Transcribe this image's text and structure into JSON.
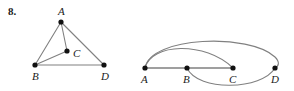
{
  "exercise": {
    "number": "8."
  },
  "style": {
    "edge_color": "#808080",
    "vertex_color": "#111111",
    "label_color": "#1a1a1a",
    "background": "#ffffff",
    "edge_width": 1.1,
    "vertex_radius": 2.6
  },
  "figures": [
    {
      "id": "left-graph",
      "name": "triangle-with-interior-point",
      "vertices": [
        {
          "id": "A",
          "label": "A",
          "x": 61,
          "y": 22,
          "label_x": 58,
          "label_y": 14
        },
        {
          "id": "B",
          "label": "B",
          "x": 35,
          "y": 65,
          "label_x": 32,
          "label_y": 79
        },
        {
          "id": "C",
          "label": "C",
          "x": 67,
          "y": 51,
          "label_x": 73,
          "label_y": 56
        },
        {
          "id": "D",
          "label": "D",
          "x": 104,
          "y": 65,
          "label_x": 101,
          "label_y": 79
        }
      ],
      "edges": [
        {
          "from": "A",
          "to": "B",
          "type": "line"
        },
        {
          "from": "A",
          "to": "D",
          "type": "line"
        },
        {
          "from": "B",
          "to": "D",
          "type": "line"
        },
        {
          "from": "A",
          "to": "C",
          "type": "line"
        },
        {
          "from": "B",
          "to": "C",
          "type": "line"
        }
      ]
    },
    {
      "id": "right-graph",
      "name": "collinear-vertices-with-arcs",
      "vertices": [
        {
          "id": "A",
          "label": "A",
          "x": 145,
          "y": 68,
          "label_x": 141,
          "label_y": 82
        },
        {
          "id": "B",
          "label": "B",
          "x": 187,
          "y": 68,
          "label_x": 183,
          "label_y": 82
        },
        {
          "id": "C",
          "label": "C",
          "x": 233,
          "y": 68,
          "label_x": 229,
          "label_y": 82
        },
        {
          "id": "D",
          "label": "D",
          "x": 275,
          "y": 68,
          "label_x": 271,
          "label_y": 82
        }
      ],
      "edges": [
        {
          "from": "A",
          "to": "B",
          "type": "line"
        },
        {
          "from": "B",
          "to": "C",
          "type": "line"
        },
        {
          "from": "A",
          "to": "D",
          "type": "arc-above",
          "path": "M145,68 C150,36 250,33 275,57 C280,62 279,66 275,68"
        },
        {
          "from": "A",
          "to": "C",
          "type": "arc-above",
          "path": "M145,68 C151,43 205,41 233,68"
        },
        {
          "from": "B",
          "to": "D",
          "type": "arc-below",
          "path": "M187,68 C198,92 262,90 275,68"
        }
      ]
    }
  ]
}
